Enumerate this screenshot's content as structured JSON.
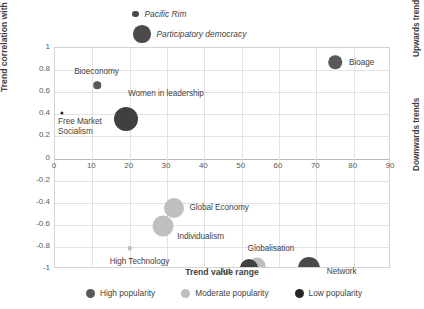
{
  "chart_data": {
    "type": "scatter",
    "title": "",
    "xlabel": "Trend value range",
    "ylabel": "Trend correlation with year",
    "xlim": [
      0,
      90
    ],
    "ylim": [
      -1,
      1
    ],
    "xticks": [
      "0",
      "10",
      "20",
      "30",
      "40",
      "50",
      "60",
      "70",
      "80",
      "90"
    ],
    "yticks": [
      "1",
      "0.8",
      "0.6",
      "0.4",
      "0.2",
      "0",
      "-0.2",
      "-0.4",
      "-0.6",
      "-0.8",
      "-1"
    ],
    "grid": true,
    "legend_position": "bottom",
    "annotations": {
      "upper_right": "Upwards trends",
      "lower_right": "Downwards trends"
    },
    "legend": [
      {
        "label": "High popularity",
        "color": "#595959"
      },
      {
        "label": "Moderate popularity",
        "color": "#bfbfbf"
      },
      {
        "label": "Low popularity",
        "color": "#262626"
      }
    ],
    "points": [
      {
        "label": "Bioage",
        "x": 75,
        "y": 0.87,
        "size": 13.5,
        "color": "#595959",
        "category": "High popularity",
        "label_dx": 14,
        "label_dy": -4
      },
      {
        "label": "Bioeconomy",
        "x": 11.3,
        "y": 0.665,
        "size": 7.5,
        "color": "#595959",
        "category": "High popularity",
        "label_dx": -23,
        "label_dy": -18
      },
      {
        "label": "Women in leadership",
        "x": 19,
        "y": 0.36,
        "size": 24,
        "color": "#404040",
        "category": "High popularity",
        "label_dx": 2,
        "label_dy": -30
      },
      {
        "label": "Free Market\nSocialism",
        "x": 1.9,
        "y": 0.41,
        "size": 3.2,
        "color": "#262626",
        "category": "Low popularity",
        "label_dx": -4,
        "label_dy": 4
      },
      {
        "label": "Global Economy",
        "x": 32,
        "y": -0.45,
        "size": 20,
        "color": "#bfbfbf",
        "category": "Moderate popularity",
        "label_dx": 15,
        "label_dy": -5
      },
      {
        "label": "Individualism",
        "x": 29,
        "y": -0.615,
        "size": 21,
        "color": "#bfbfbf",
        "category": "Moderate popularity",
        "label_dx": 14,
        "label_dy": 6
      },
      {
        "label": "High Technology",
        "x": 20,
        "y": -0.81,
        "size": 4.5,
        "color": "#bfbfbf",
        "category": "Moderate popularity",
        "label_dx": -20,
        "label_dy": 9
      },
      {
        "label": "Globalisation",
        "x": 54,
        "y": -0.97,
        "size": 17,
        "color": "#bfbfbf",
        "category": "Moderate popularity",
        "label_dx": -9,
        "label_dy": -22
      },
      {
        "label": "Art",
        "x": 52,
        "y": -0.99,
        "size": 18,
        "color": "#404040",
        "category": "High popularity",
        "label_dx": -29,
        "label_dy": -1
      },
      {
        "label": "Network",
        "x": 68,
        "y": -0.99,
        "size": 22,
        "color": "#4a4a4a",
        "category": "High popularity",
        "label_dx": 18,
        "label_dy": -1
      }
    ],
    "floating_points": [
      {
        "label": "Pacific Rim",
        "size": 6.5,
        "color": "#4a4a4a",
        "left": 132,
        "top": 9
      },
      {
        "label": "Participatory democracy",
        "size": 17.5,
        "color": "#4a4a4a",
        "left": 133,
        "top": 25
      }
    ]
  }
}
